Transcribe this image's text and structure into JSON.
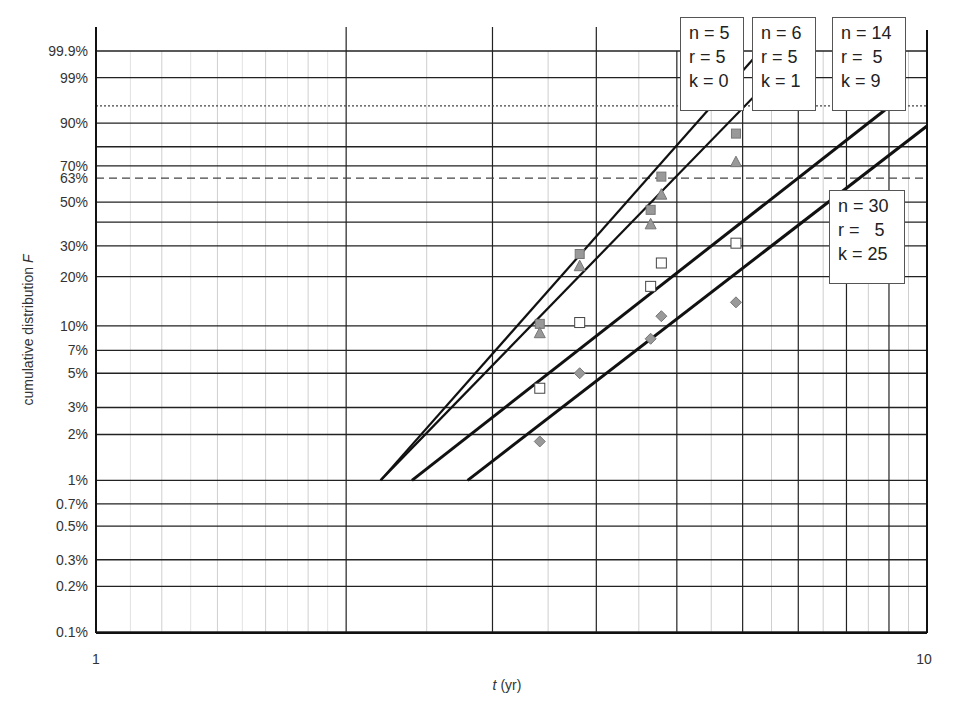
{
  "chart_data": {
    "type": "scatter",
    "title": "",
    "xlabel_italic": "t",
    "xlabel_rest": " (yr)",
    "xlabel": "t (yr)",
    "ylabel": "cumulative distribution F",
    "ylabel_main": "cumulative distribution ",
    "ylabel_italic": "F",
    "x_scale": "log",
    "y_scale": "weibull",
    "xlim": [
      1,
      10
    ],
    "ylim_percent": [
      0.1,
      99.9
    ],
    "x_tick_labels": [
      "1",
      "10"
    ],
    "y_ticks": [
      {
        "label": "99.9%",
        "value": 0.999
      },
      {
        "label": "99%",
        "value": 0.99
      },
      {
        "label": "90%",
        "value": 0.9
      },
      {
        "label": "70%",
        "value": 0.7
      },
      {
        "label": "63%",
        "value": 0.632
      },
      {
        "label": "50%",
        "value": 0.5
      },
      {
        "label": "30%",
        "value": 0.3
      },
      {
        "label": "20%",
        "value": 0.2
      },
      {
        "label": "10%",
        "value": 0.1
      },
      {
        "label": "7%",
        "value": 0.07
      },
      {
        "label": "5%",
        "value": 0.05
      },
      {
        "label": "3%",
        "value": 0.03
      },
      {
        "label": "2%",
        "value": 0.02
      },
      {
        "label": "1%",
        "value": 0.01
      },
      {
        "label": "0.7%",
        "value": 0.007
      },
      {
        "label": "0.5%",
        "value": 0.005
      },
      {
        "label": "0.3%",
        "value": 0.003
      },
      {
        "label": "0.2%",
        "value": 0.002
      },
      {
        "label": "0.1%",
        "value": 0.001
      }
    ],
    "y_unlabeled_gridlines": [
      0.8,
      0.4
    ],
    "reference_lines": [
      {
        "value": 0.95,
        "style": "dotted"
      },
      {
        "value": 0.632,
        "style": "dashed"
      }
    ],
    "grid": true,
    "series": [
      {
        "name": "n = 5, r = 5, k = 0",
        "marker": "square-filled",
        "color": "#999999",
        "points": [
          [
            3.42,
            0.103
          ],
          [
            3.82,
            0.27
          ],
          [
            4.65,
            0.46
          ],
          [
            4.79,
            0.64
          ],
          [
            5.89,
            0.86
          ]
        ],
        "fit_line": {
          "from": [
            2.2,
            0.01
          ],
          "to": [
            6.3,
            0.999
          ]
        }
      },
      {
        "name": "n = 6, r = 5, k = 1",
        "marker": "triangle-filled",
        "color": "#999999",
        "points": [
          [
            3.42,
            0.09
          ],
          [
            3.82,
            0.23
          ],
          [
            4.65,
            0.39
          ],
          [
            4.79,
            0.54
          ],
          [
            5.89,
            0.72
          ]
        ],
        "fit_line": {
          "from": [
            2.2,
            0.01
          ],
          "to": [
            7.0,
            0.999
          ]
        }
      },
      {
        "name": "n = 14, r = 5, k = 9",
        "marker": "square-open",
        "color": "#ffffff",
        "points": [
          [
            3.42,
            0.04
          ],
          [
            3.82,
            0.105
          ],
          [
            4.65,
            0.175
          ],
          [
            4.79,
            0.24
          ],
          [
            5.89,
            0.31
          ]
        ],
        "fit_line": {
          "from": [
            2.4,
            0.01
          ],
          "to": [
            8.9,
            0.94
          ]
        }
      },
      {
        "name": "n = 30, r = 5, k = 25",
        "marker": "diamond-filled",
        "color": "#999999",
        "points": [
          [
            3.42,
            0.018
          ],
          [
            3.82,
            0.05
          ],
          [
            4.65,
            0.083
          ],
          [
            4.79,
            0.115
          ],
          [
            5.89,
            0.14
          ]
        ],
        "fit_line": {
          "from": [
            2.8,
            0.01
          ],
          "to": [
            10.0,
            0.89
          ]
        }
      }
    ],
    "legend_position": "annotations near line ends (top right)"
  },
  "legends": [
    {
      "text": "n = 5\nr = 5\nk = 0"
    },
    {
      "text": "n = 6\nr = 5\nk = 1"
    },
    {
      "text": "n = 14\nr =  5\nk = 9"
    },
    {
      "text": "n = 30\nr =   5\nk = 25"
    }
  ]
}
